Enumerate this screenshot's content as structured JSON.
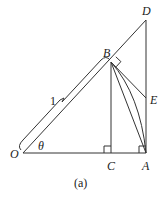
{
  "diagram": {
    "caption": "(a)",
    "points": {
      "O": {
        "label": "O",
        "x": 23,
        "y": 153
      },
      "C": {
        "label": "C",
        "x": 111,
        "y": 153
      },
      "A": {
        "label": "A",
        "x": 146,
        "y": 153
      },
      "B": {
        "label": "B",
        "x": 111,
        "y": 62
      },
      "D": {
        "label": "D",
        "x": 146,
        "y": 20
      },
      "E": {
        "label": "E",
        "x": 146,
        "y": 98
      }
    },
    "angle_label": "θ",
    "length_label": "1",
    "stroke_color": "#333333"
  }
}
